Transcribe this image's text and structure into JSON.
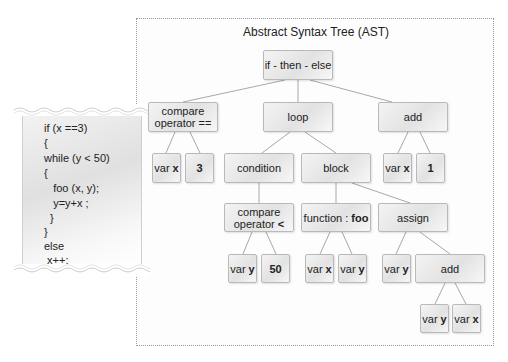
{
  "diagram": {
    "title": "Abstract Syntax Tree (AST)",
    "code_snippet": {
      "lines": [
        "if (x ==3)",
        "{",
        "while (y < 50)",
        "{",
        "   foo (x, y);",
        "   y=y+x ;",
        "  }",
        "}",
        "else",
        " x++;"
      ]
    },
    "nodes": {
      "root": {
        "label": "if - then - else"
      },
      "cmp_eq": {
        "line1": "compare",
        "line2": "operator =="
      },
      "loop": {
        "label": "loop"
      },
      "add_top": {
        "label": "add"
      },
      "cmp_eq_var": {
        "prefix": "var",
        "name": "x"
      },
      "cmp_eq_const": {
        "value": "3"
      },
      "condition": {
        "label": "condition"
      },
      "block": {
        "label": "block"
      },
      "add_top_var": {
        "prefix": "var",
        "name": "x"
      },
      "add_top_const": {
        "value": "1"
      },
      "cmp_lt": {
        "line1": "compare",
        "line2": "operator",
        "op": "<"
      },
      "func": {
        "prefix": "function :",
        "name": "foo"
      },
      "assign": {
        "label": "assign"
      },
      "cmp_lt_var": {
        "prefix": "var",
        "name": "y"
      },
      "cmp_lt_const": {
        "value": "50"
      },
      "func_arg1": {
        "prefix": "var",
        "name": "x"
      },
      "func_arg2": {
        "prefix": "var",
        "name": "y"
      },
      "assign_target": {
        "prefix": "var",
        "name": "y"
      },
      "assign_add": {
        "label": "add"
      },
      "assign_add_var1": {
        "prefix": "var",
        "name": "y"
      },
      "assign_add_var2": {
        "prefix": "var",
        "name": "x"
      }
    },
    "colors": {
      "node_fill": "#e6e6e6",
      "node_border": "#b9b9b9",
      "edge": "#a8a8a8",
      "frame_border": "#9a9a9a"
    }
  }
}
